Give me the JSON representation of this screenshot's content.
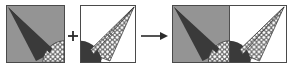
{
  "figure": {
    "kind": "geometry-diagram",
    "caption": "",
    "operation_sequence": [
      "square-a",
      "plus",
      "square-b",
      "arrow-right",
      "composite-rectangle"
    ],
    "colors": {
      "background": "#ffffff",
      "gray_fill": "#949494",
      "dark_fill": "#3a3a3a",
      "mid_dark_fill": "#5a5a5a",
      "pattern_stroke": "#4a4a4a",
      "pattern_fill": "#ffffff",
      "border": "#4a4a4a",
      "white_fill": "#ffffff"
    },
    "operators": {
      "plus": {
        "symbol": "+",
        "name": "plus-operator",
        "x": 68,
        "y": 31,
        "width": 10,
        "height": 10
      },
      "arrow": {
        "symbol": "→",
        "name": "arrow-right-operator",
        "x": 141,
        "y": 30,
        "width": 28,
        "height": 12
      }
    },
    "panels": [
      {
        "id": "square-a",
        "name": "square-a",
        "label": "",
        "x": 6,
        "y": 5,
        "width": 59,
        "height": 58,
        "background": "gray",
        "shapes": [
          "dark-cone-triangle",
          "checkered-corner-wedge"
        ]
      },
      {
        "id": "square-b",
        "name": "square-b",
        "label": "",
        "x": 80,
        "y": 5,
        "width": 56,
        "height": 58,
        "background": "white",
        "shapes": [
          "checkered-cone-triangle",
          "dark-corner-wedge"
        ]
      },
      {
        "id": "composite-rectangle",
        "name": "composite-rectangle",
        "label": "",
        "x": 172,
        "y": 5,
        "width": 115,
        "height": 58,
        "background": "split-gray-white",
        "shapes": [
          "dark-cone-triangle",
          "checkered-cone-triangle",
          "center-dark-lens",
          "divider-line"
        ]
      }
    ]
  }
}
